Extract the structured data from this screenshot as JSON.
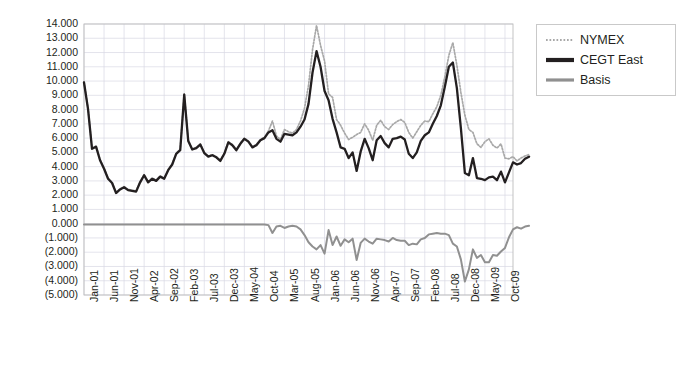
{
  "chart_data": {
    "type": "line",
    "title": "",
    "xlabel": "",
    "ylabel": "",
    "ylim": [
      -5000,
      14000
    ],
    "grid": true,
    "legend_position": "right",
    "y_ticks": [
      "14.000",
      "13.000",
      "12.000",
      "11.000",
      "10.000",
      "9.000",
      "8.000",
      "7.000",
      "6.000",
      "5.000",
      "4.000",
      "3.000",
      "2.000",
      "1.000",
      "0.000",
      "(1.000)",
      "(2.000)",
      "(3.000)",
      "(4.000)",
      "(5.000)"
    ],
    "y_tick_values": [
      14000,
      13000,
      12000,
      11000,
      10000,
      9000,
      8000,
      7000,
      6000,
      5000,
      4000,
      3000,
      2000,
      1000,
      0,
      -1000,
      -2000,
      -3000,
      -4000,
      -5000
    ],
    "x_tick_labels": [
      "Jan-01",
      "Jun-01",
      "Nov-01",
      "Apr-02",
      "Sep-02",
      "Feb-03",
      "Jul-03",
      "Dec-03",
      "May-04",
      "Oct-04",
      "Mar-05",
      "Aug-05",
      "Jan-06",
      "Jun-06",
      "Nov-06",
      "Apr-07",
      "Sep-07",
      "Feb-08",
      "Jul-08",
      "Dec-08",
      "May-09",
      "Oct-09"
    ],
    "x_tick_indices": [
      0,
      5,
      10,
      15,
      20,
      25,
      30,
      35,
      40,
      45,
      50,
      55,
      60,
      65,
      70,
      75,
      80,
      85,
      90,
      95,
      100,
      105
    ],
    "x_count": 108,
    "series": [
      {
        "name": "NYMEX",
        "color": "#a8a8a8",
        "style": "dotted",
        "values": [
          9.95,
          8.1,
          5.3,
          5.45,
          4.5,
          3.9,
          3.2,
          2.9,
          2.2,
          2.45,
          2.6,
          2.4,
          2.35,
          2.3,
          2.95,
          3.45,
          2.95,
          3.2,
          3.05,
          3.35,
          3.2,
          3.8,
          4.2,
          4.95,
          5.2,
          9.1,
          5.85,
          5.25,
          5.35,
          5.6,
          5.0,
          4.75,
          4.85,
          4.7,
          4.45,
          4.95,
          5.75,
          5.55,
          5.2,
          5.65,
          6.0,
          5.8,
          5.4,
          5.55,
          5.9,
          6.05,
          6.5,
          7.2,
          6.15,
          5.9,
          6.6,
          6.45,
          6.35,
          6.6,
          7.2,
          8.1,
          9.7,
          12.2,
          13.9,
          12.5,
          11.4,
          9.1,
          8.85,
          7.3,
          6.9,
          6.35,
          5.9,
          6.05,
          6.25,
          6.4,
          7.0,
          6.55,
          5.85,
          6.9,
          7.25,
          6.8,
          6.6,
          6.95,
          7.15,
          7.3,
          7.1,
          6.4,
          6.0,
          6.45,
          6.9,
          7.2,
          7.15,
          7.7,
          8.2,
          9.0,
          10.3,
          11.8,
          12.7,
          11.1,
          9.2,
          7.6,
          6.6,
          6.4,
          5.6,
          5.35,
          5.75,
          5.95,
          5.5,
          5.3,
          5.6,
          4.6,
          4.55,
          4.7,
          4.4,
          4.6,
          4.75,
          4.85
        ]
      },
      {
        "name": "CEGT East",
        "color": "#231f20",
        "style": "solid",
        "values": [
          9.9,
          8.05,
          5.25,
          5.4,
          4.45,
          3.85,
          3.15,
          2.85,
          2.15,
          2.4,
          2.55,
          2.35,
          2.3,
          2.25,
          2.9,
          3.4,
          2.9,
          3.15,
          3.0,
          3.3,
          3.15,
          3.75,
          4.15,
          4.9,
          5.15,
          9.05,
          5.8,
          5.2,
          5.3,
          5.55,
          4.95,
          4.7,
          4.8,
          4.65,
          4.4,
          4.9,
          5.7,
          5.5,
          5.15,
          5.6,
          5.95,
          5.75,
          5.35,
          5.5,
          5.85,
          6.0,
          6.4,
          6.55,
          5.95,
          5.75,
          6.3,
          6.25,
          6.2,
          6.4,
          6.8,
          7.3,
          8.4,
          10.6,
          12.1,
          11.0,
          9.3,
          8.65,
          7.35,
          6.4,
          5.35,
          5.25,
          4.6,
          5.0,
          3.7,
          5.05,
          5.95,
          5.3,
          4.45,
          5.85,
          6.15,
          5.65,
          5.35,
          5.95,
          6.0,
          6.1,
          5.9,
          4.9,
          4.6,
          5.0,
          5.8,
          6.2,
          6.4,
          7.0,
          7.55,
          8.3,
          9.6,
          11.0,
          11.3,
          9.5,
          6.7,
          3.55,
          3.4,
          4.6,
          3.2,
          3.15,
          3.05,
          3.25,
          3.3,
          3.05,
          3.65,
          2.9,
          3.6,
          4.3,
          4.15,
          4.25,
          4.55,
          4.7
        ]
      },
      {
        "name": "Basis",
        "color": "#909090",
        "style": "solid",
        "values": [
          -0.05,
          -0.05,
          -0.05,
          -0.05,
          -0.05,
          -0.05,
          -0.05,
          -0.05,
          -0.05,
          -0.05,
          -0.05,
          -0.05,
          -0.05,
          -0.05,
          -0.05,
          -0.05,
          -0.05,
          -0.05,
          -0.05,
          -0.05,
          -0.05,
          -0.05,
          -0.05,
          -0.05,
          -0.05,
          -0.05,
          -0.05,
          -0.05,
          -0.05,
          -0.05,
          -0.05,
          -0.05,
          -0.05,
          -0.05,
          -0.05,
          -0.05,
          -0.05,
          -0.05,
          -0.05,
          -0.05,
          -0.05,
          -0.05,
          -0.05,
          -0.05,
          -0.05,
          -0.05,
          -0.1,
          -0.65,
          -0.2,
          -0.15,
          -0.3,
          -0.2,
          -0.15,
          -0.2,
          -0.4,
          -0.8,
          -1.3,
          -1.6,
          -1.8,
          -1.5,
          -2.1,
          -0.45,
          -1.5,
          -0.9,
          -1.55,
          -1.1,
          -1.3,
          -1.05,
          -2.55,
          -1.35,
          -1.05,
          -1.25,
          -1.4,
          -1.05,
          -1.1,
          -1.15,
          -1.25,
          -1.0,
          -1.15,
          -1.2,
          -1.2,
          -1.5,
          -1.4,
          -1.45,
          -1.1,
          -1.0,
          -0.75,
          -0.7,
          -0.65,
          -0.7,
          -0.7,
          -0.8,
          -1.4,
          -1.6,
          -2.5,
          -4.05,
          -3.2,
          -1.8,
          -2.4,
          -2.2,
          -2.7,
          -2.7,
          -2.2,
          -2.25,
          -1.95,
          -1.7,
          -0.95,
          -0.4,
          -0.25,
          -0.35,
          -0.2,
          -0.15
        ]
      }
    ]
  },
  "legend": {
    "items": [
      {
        "label": "NYMEX"
      },
      {
        "label": "CEGT East"
      },
      {
        "label": "Basis"
      }
    ]
  }
}
